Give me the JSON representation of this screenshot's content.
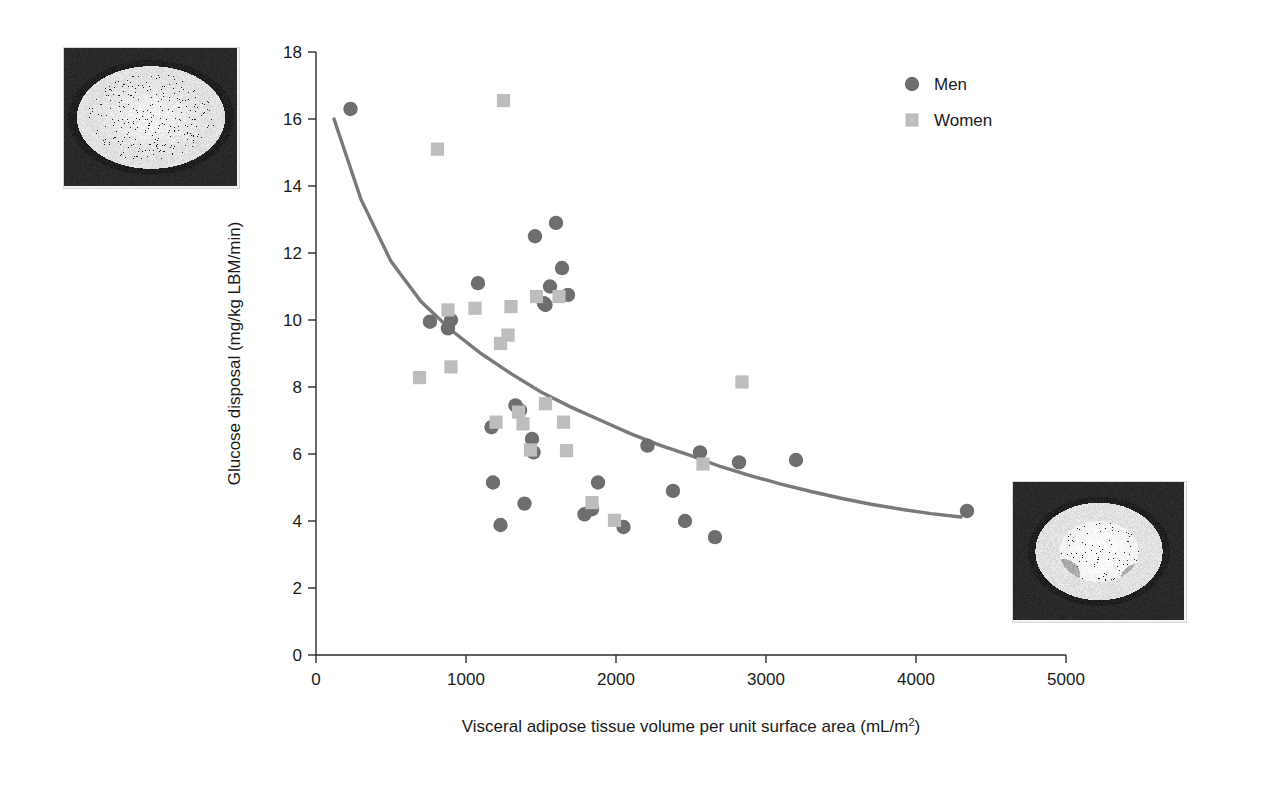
{
  "figure": {
    "type": "scatter-with-fit-curve",
    "background_color": "#ffffff"
  },
  "axes": {
    "x": {
      "title": "Visceral adipose tissue volume per unit surface area (mL/m",
      "title_superscript": "2",
      "title_suffix": ")",
      "ticks": [
        "0",
        "1000",
        "2000",
        "3000",
        "4000",
        "5000"
      ],
      "min": 0,
      "max": 5000
    },
    "y": {
      "title": "Glucose disposal (mg/kg LBM/min)",
      "ticks": [
        "0",
        "2",
        "4",
        "6",
        "8",
        "10",
        "12",
        "14",
        "16",
        "18"
      ],
      "min": 0,
      "max": 18
    }
  },
  "legend": {
    "position": "top-right",
    "entries": [
      {
        "label": "Men",
        "marker": "circle",
        "color": "#6e6e6e"
      },
      {
        "label": "Women",
        "marker": "square",
        "color": "#bdbdbd"
      }
    ]
  },
  "images": {
    "top_left": {
      "name": "abdominal-mri-high-visceral-fat"
    },
    "bottom_right": {
      "name": "abdominal-mri-low-visceral-fat"
    }
  },
  "chart_data": {
    "type": "scatter",
    "title": "",
    "xlabel": "Visceral adipose tissue volume per unit surface area (mL/m2)",
    "ylabel": "Glucose disposal (mg/kg LBM/min)",
    "xlim": [
      0,
      5000
    ],
    "ylim": [
      0,
      18
    ],
    "grid": false,
    "legend_position": "top-right",
    "series": [
      {
        "name": "Men",
        "marker": "circle",
        "color": "#6e6e6e",
        "points": [
          [
            230,
            16.3
          ],
          [
            760,
            9.95
          ],
          [
            880,
            9.75
          ],
          [
            900,
            10.0
          ],
          [
            1080,
            11.1
          ],
          [
            1170,
            6.8
          ],
          [
            1180,
            5.15
          ],
          [
            1230,
            3.88
          ],
          [
            1330,
            7.45
          ],
          [
            1360,
            7.3
          ],
          [
            1390,
            4.52
          ],
          [
            1440,
            6.45
          ],
          [
            1450,
            6.05
          ],
          [
            1460,
            12.5
          ],
          [
            1520,
            10.5
          ],
          [
            1530,
            10.45
          ],
          [
            1560,
            11.0
          ],
          [
            1600,
            12.9
          ],
          [
            1640,
            11.55
          ],
          [
            1680,
            10.75
          ],
          [
            1790,
            4.2
          ],
          [
            1840,
            4.35
          ],
          [
            1880,
            5.15
          ],
          [
            2050,
            3.82
          ],
          [
            2210,
            6.25
          ],
          [
            2380,
            4.9
          ],
          [
            2460,
            4.0
          ],
          [
            2560,
            6.05
          ],
          [
            2660,
            3.52
          ],
          [
            2820,
            5.75
          ],
          [
            3200,
            5.82
          ],
          [
            4340,
            4.3
          ]
        ]
      },
      {
        "name": "Women",
        "marker": "square",
        "color": "#bdbdbd",
        "points": [
          [
            690,
            8.28
          ],
          [
            810,
            15.1
          ],
          [
            880,
            10.3
          ],
          [
            900,
            8.6
          ],
          [
            1060,
            10.35
          ],
          [
            1200,
            6.95
          ],
          [
            1230,
            9.3
          ],
          [
            1250,
            16.55
          ],
          [
            1280,
            9.55
          ],
          [
            1300,
            10.4
          ],
          [
            1350,
            7.25
          ],
          [
            1380,
            6.9
          ],
          [
            1430,
            6.12
          ],
          [
            1470,
            10.7
          ],
          [
            1530,
            7.5
          ],
          [
            1620,
            10.7
          ],
          [
            1650,
            6.95
          ],
          [
            1670,
            6.1
          ],
          [
            1840,
            4.55
          ],
          [
            1990,
            4.02
          ],
          [
            2580,
            5.7
          ],
          [
            2840,
            8.15
          ]
        ]
      }
    ],
    "fit_curve": {
      "name": "exponential-decay-fit",
      "color": "#7a7a7a",
      "line_width": 3.4,
      "points": [
        [
          120,
          16.0
        ],
        [
          300,
          13.6
        ],
        [
          500,
          11.75
        ],
        [
          700,
          10.55
        ],
        [
          900,
          9.7
        ],
        [
          1100,
          9.0
        ],
        [
          1300,
          8.4
        ],
        [
          1500,
          7.85
        ],
        [
          1700,
          7.4
        ],
        [
          1900,
          7.0
        ],
        [
          2100,
          6.6
        ],
        [
          2300,
          6.25
        ],
        [
          2500,
          5.95
        ],
        [
          2700,
          5.62
        ],
        [
          2900,
          5.35
        ],
        [
          3100,
          5.1
        ],
        [
          3300,
          4.88
        ],
        [
          3500,
          4.68
        ],
        [
          3700,
          4.5
        ],
        [
          3900,
          4.35
        ],
        [
          4100,
          4.22
        ],
        [
          4300,
          4.12
        ]
      ]
    }
  }
}
